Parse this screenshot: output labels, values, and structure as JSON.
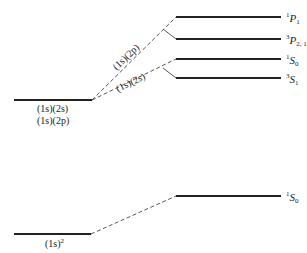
{
  "diagram": {
    "type": "energy-level-diagram",
    "colors": {
      "line": "#222222",
      "dashed": "#444444",
      "text": "#222222"
    },
    "excited_configuration": {
      "labels": [
        "(1s)(2s)",
        "(1s)(2p)"
      ]
    },
    "branches": [
      {
        "label": "(1s)(2p)",
        "terms": [
          {
            "multiplicity": "1",
            "L": "P",
            "J": "1"
          },
          {
            "multiplicity": "3",
            "L": "P",
            "J": "2, 1, 0"
          }
        ]
      },
      {
        "label": "(1s)(2s)",
        "terms": [
          {
            "multiplicity": "1",
            "L": "S",
            "J": "0"
          },
          {
            "multiplicity": "3",
            "L": "S",
            "J": "1"
          }
        ]
      }
    ],
    "ground_configuration": {
      "label": "(1s)",
      "exponent": "2",
      "term": {
        "multiplicity": "1",
        "L": "S",
        "J": "0"
      }
    }
  }
}
